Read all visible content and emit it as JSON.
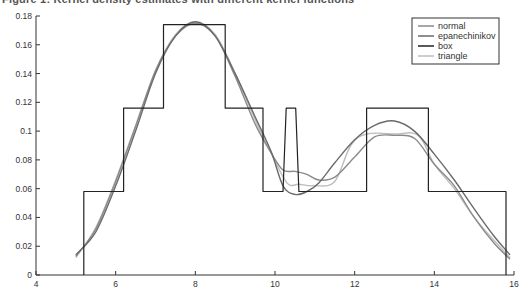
{
  "chart_data": {
    "type": "line",
    "title": "Figure 1: Kernel density estimates with different kernel functions",
    "xlabel": "",
    "ylabel": "",
    "xlim": [
      4,
      16
    ],
    "ylim": [
      0,
      0.18
    ],
    "x_ticks": [
      4,
      6,
      8,
      10,
      12,
      14,
      16
    ],
    "x_tick_labels": [
      "4",
      "6",
      "8",
      "10",
      "12",
      "14",
      "16"
    ],
    "y_ticks": [
      0,
      0.02,
      0.04,
      0.06,
      0.08,
      0.1,
      0.12,
      0.14,
      0.16,
      0.18
    ],
    "y_tick_labels": [
      "0",
      "0.02",
      "0.04",
      "0.06",
      "0.08",
      "0.1",
      "0.12",
      "0.14",
      "0.16",
      "0.18"
    ],
    "grid": false,
    "legend_position": "top-right",
    "series": [
      {
        "name": "normal",
        "color": "#8a8a8a",
        "x": [
          5.0,
          5.5,
          6.0,
          6.5,
          7.0,
          7.5,
          8.0,
          8.5,
          9.0,
          9.5,
          9.9,
          10.2,
          10.5,
          10.8,
          11.1,
          11.5,
          12.0,
          12.5,
          13.0,
          13.5,
          14.0,
          14.5,
          15.0,
          15.5,
          15.9
        ],
        "y": [
          0.013,
          0.032,
          0.065,
          0.103,
          0.142,
          0.166,
          0.175,
          0.166,
          0.138,
          0.105,
          0.085,
          0.073,
          0.072,
          0.07,
          0.066,
          0.068,
          0.082,
          0.096,
          0.097,
          0.095,
          0.077,
          0.062,
          0.04,
          0.022,
          0.011
        ]
      },
      {
        "name": "epanechinikov",
        "color": "#6a6a6a",
        "x": [
          5.0,
          5.5,
          6.0,
          6.5,
          7.0,
          7.5,
          8.0,
          8.5,
          9.0,
          9.5,
          9.9,
          10.2,
          10.5,
          10.8,
          11.1,
          11.5,
          12.0,
          12.5,
          13.0,
          13.5,
          14.0,
          14.5,
          15.0,
          15.5,
          15.9
        ],
        "y": [
          0.014,
          0.03,
          0.062,
          0.1,
          0.14,
          0.166,
          0.176,
          0.166,
          0.14,
          0.11,
          0.086,
          0.062,
          0.056,
          0.058,
          0.064,
          0.078,
          0.094,
          0.104,
          0.107,
          0.1,
          0.084,
          0.066,
          0.046,
          0.027,
          0.014
        ]
      },
      {
        "name": "box",
        "color": "#222222",
        "x": [
          5.2,
          5.2,
          6.2,
          6.2,
          7.2,
          7.2,
          8.75,
          8.75,
          9.7,
          9.7,
          10.2,
          10.28,
          10.52,
          10.6,
          12.3,
          12.3,
          13.85,
          13.85,
          15.8,
          15.8
        ],
        "y": [
          0,
          0.058,
          0.058,
          0.116,
          0.116,
          0.174,
          0.174,
          0.116,
          0.116,
          0.058,
          0.058,
          0.116,
          0.116,
          0.058,
          0.058,
          0.116,
          0.116,
          0.058,
          0.058,
          0
        ]
      },
      {
        "name": "triangle",
        "color": "#bdbdbd",
        "x": [
          5.0,
          5.5,
          6.0,
          6.5,
          7.0,
          7.5,
          8.0,
          8.5,
          9.0,
          9.5,
          9.9,
          10.3,
          10.6,
          11.0,
          11.5,
          11.9,
          12.3,
          13.0,
          13.6,
          14.0,
          14.5,
          15.0,
          15.5,
          15.9
        ],
        "y": [
          0.012,
          0.033,
          0.066,
          0.104,
          0.142,
          0.167,
          0.176,
          0.167,
          0.14,
          0.108,
          0.085,
          0.064,
          0.063,
          0.062,
          0.065,
          0.09,
          0.098,
          0.098,
          0.097,
          0.077,
          0.06,
          0.04,
          0.024,
          0.012
        ]
      }
    ]
  }
}
